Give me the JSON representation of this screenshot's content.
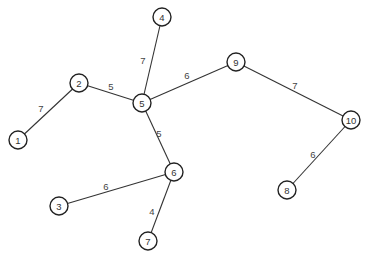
{
  "graph": {
    "nodes": [
      {
        "id": "1",
        "label": "1",
        "x": 18,
        "y": 140
      },
      {
        "id": "2",
        "label": "2",
        "x": 79,
        "y": 83
      },
      {
        "id": "3",
        "label": "3",
        "x": 59,
        "y": 206
      },
      {
        "id": "4",
        "label": "4",
        "x": 162,
        "y": 17
      },
      {
        "id": "5",
        "label": "5",
        "x": 142,
        "y": 103
      },
      {
        "id": "6",
        "label": "6",
        "x": 174,
        "y": 172
      },
      {
        "id": "7",
        "label": "7",
        "x": 148,
        "y": 241
      },
      {
        "id": "8",
        "label": "8",
        "x": 287,
        "y": 190
      },
      {
        "id": "9",
        "label": "9",
        "x": 236,
        "y": 62
      },
      {
        "id": "10",
        "label": "10",
        "x": 351,
        "y": 120
      }
    ],
    "edges": [
      {
        "from": "1",
        "to": "2",
        "weight": "7",
        "lx": 41,
        "ly": 108
      },
      {
        "from": "2",
        "to": "5",
        "weight": "5",
        "lx": 111,
        "ly": 86
      },
      {
        "from": "4",
        "to": "5",
        "weight": "7",
        "lx": 143,
        "ly": 60
      },
      {
        "from": "5",
        "to": "9",
        "weight": "6",
        "lx": 187,
        "ly": 75
      },
      {
        "from": "5",
        "to": "6",
        "weight": "5",
        "lx": 159,
        "ly": 133
      },
      {
        "from": "9",
        "to": "10",
        "weight": "7",
        "lx": 295,
        "ly": 85
      },
      {
        "from": "10",
        "to": "8",
        "weight": "6",
        "lx": 313,
        "ly": 154
      },
      {
        "from": "3",
        "to": "6",
        "weight": "6",
        "lx": 106,
        "ly": 186
      },
      {
        "from": "6",
        "to": "7",
        "weight": "4",
        "lx": 152,
        "ly": 211
      }
    ]
  }
}
